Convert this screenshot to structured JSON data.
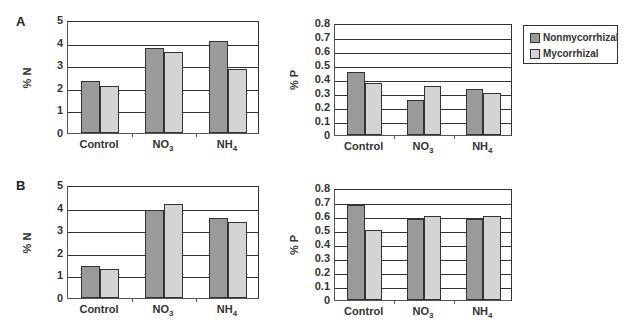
{
  "colors": {
    "nonmycorrhizal": "#9a9a9a",
    "mycorrhizal": "#d4d4d4"
  },
  "legend": {
    "items": [
      {
        "label": "Nonmycorrhizal",
        "color": "#9a9a9a"
      },
      {
        "label": "Mycorrhizal",
        "color": "#d4d4d4"
      }
    ]
  },
  "panels": {
    "a": "A",
    "b": "B"
  },
  "chart_data": [
    {
      "type": "bar",
      "panel": "A",
      "title": "",
      "ylabel": "% N",
      "xlabel": "",
      "categories": [
        "Control",
        "NO3",
        "NH4"
      ],
      "ylim": [
        0,
        5
      ],
      "yticks": [
        0,
        1,
        2,
        3,
        4,
        5
      ],
      "grid": true,
      "series": [
        {
          "name": "Nonmycorrhizal",
          "values": [
            2.3,
            3.76,
            4.05
          ]
        },
        {
          "name": "Mycorrhizal",
          "values": [
            2.07,
            3.57,
            2.83
          ]
        }
      ]
    },
    {
      "type": "bar",
      "panel": "A",
      "title": "",
      "ylabel": "% P",
      "xlabel": "",
      "categories": [
        "Control",
        "NO3",
        "NH4"
      ],
      "ylim": [
        0,
        0.8
      ],
      "yticks": [
        0,
        0.1,
        0.2,
        0.3,
        0.4,
        0.5,
        0.6,
        0.7,
        0.8
      ],
      "grid": true,
      "series": [
        {
          "name": "Nonmycorrhizal",
          "values": [
            0.45,
            0.25,
            0.33
          ]
        },
        {
          "name": "Mycorrhizal",
          "values": [
            0.37,
            0.35,
            0.3
          ]
        }
      ]
    },
    {
      "type": "bar",
      "panel": "B",
      "title": "",
      "ylabel": "% N",
      "xlabel": "",
      "categories": [
        "Control",
        "NO3",
        "NH4"
      ],
      "ylim": [
        0,
        5
      ],
      "yticks": [
        0,
        1,
        2,
        3,
        4,
        5
      ],
      "grid": true,
      "series": [
        {
          "name": "Nonmycorrhizal",
          "values": [
            1.41,
            3.88,
            3.54
          ]
        },
        {
          "name": "Mycorrhizal",
          "values": [
            1.29,
            4.15,
            3.36
          ]
        }
      ]
    },
    {
      "type": "bar",
      "panel": "B",
      "title": "",
      "ylabel": "% P",
      "xlabel": "",
      "categories": [
        "Control",
        "NO3",
        "NH4"
      ],
      "ylim": [
        0,
        0.8
      ],
      "yticks": [
        0,
        0.1,
        0.2,
        0.3,
        0.4,
        0.5,
        0.6,
        0.7,
        0.8
      ],
      "grid": true,
      "series": [
        {
          "name": "Nonmycorrhizal",
          "values": [
            0.68,
            0.58,
            0.58
          ]
        },
        {
          "name": "Mycorrhizal",
          "values": [
            0.5,
            0.6,
            0.6
          ]
        }
      ]
    }
  ]
}
